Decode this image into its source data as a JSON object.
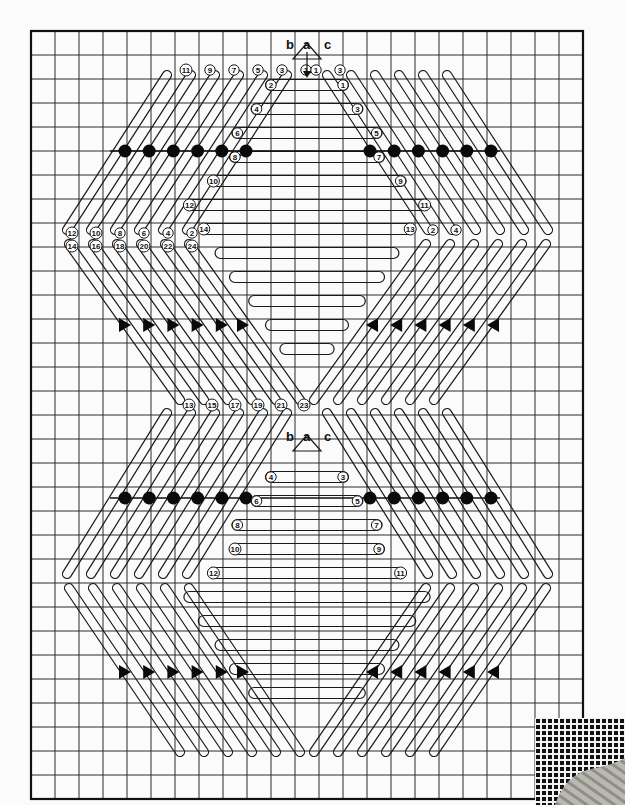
{
  "diagram": {
    "grid": {
      "origin_x": 31,
      "origin_y": 31,
      "cell": 24,
      "cols": 23,
      "rows": 32
    },
    "colors": {
      "ink": "#111111",
      "paper": "#fbfbfb",
      "yarn": "#b8b8b0"
    },
    "top_motif": {
      "letters": [
        {
          "text": "b",
          "x": 286,
          "y": 49
        },
        {
          "text": "a",
          "x": 303,
          "y": 49
        },
        {
          "text": "c",
          "x": 324,
          "y": 49
        }
      ],
      "left_diagonal_labels": [
        "11",
        "9",
        "7",
        "5",
        "3",
        "1"
      ],
      "right_diagonal_labels": [
        "1",
        "3"
      ],
      "center_bar_labels": [
        {
          "left": "2",
          "right": "1"
        },
        {
          "left": "4",
          "right": "3"
        },
        {
          "left": "6",
          "right": "5"
        },
        {
          "left": "8",
          "right": "7"
        },
        {
          "left": "10",
          "right": "9"
        },
        {
          "left": "12",
          "right": "11"
        },
        {
          "left": "14",
          "right": "13"
        }
      ],
      "left_point_labels_upper": [
        "12",
        "10",
        "8",
        "6",
        "4",
        "2"
      ],
      "left_point_labels_lower": [
        "14",
        "16",
        "18",
        "20",
        "22",
        "24"
      ],
      "right_point_labels": [
        "2",
        "4"
      ],
      "dots_row_y": 151,
      "arrows_row_y": 325
    },
    "bottom_motif": {
      "letters": [
        {
          "text": "b",
          "x": 286,
          "y": 441
        },
        {
          "text": "a",
          "x": 303,
          "y": 441
        },
        {
          "text": "c",
          "x": 324,
          "y": 441
        }
      ],
      "upper_left_labels": [
        "13",
        "15",
        "17",
        "19",
        "21",
        "23"
      ],
      "center_bar_labels": [
        {
          "left": "4",
          "right": "3"
        },
        {
          "left": "6",
          "right": "5"
        },
        {
          "left": "8",
          "right": "7"
        },
        {
          "left": "10",
          "right": "9"
        },
        {
          "left": "12",
          "right": "11"
        }
      ],
      "dots_row_y": 498,
      "arrows_row_y": 672
    },
    "inset_photo": {
      "description": "canvas mesh and worked yarn swatch"
    }
  }
}
